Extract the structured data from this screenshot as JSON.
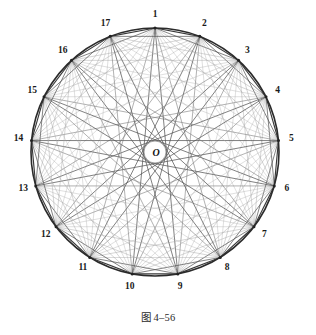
{
  "figure": {
    "caption": "图 4–56",
    "center_point_label": "O",
    "vertex_count": 17,
    "vertex_labels": [
      "1",
      "2",
      "3",
      "4",
      "5",
      "6",
      "7",
      "8",
      "9",
      "10",
      "11",
      "12",
      "13",
      "14",
      "15",
      "16",
      "17"
    ],
    "colors": {
      "background": "#ffffff",
      "circle_outline": "#2b2b2b",
      "chord_dark": "#555555",
      "chord_mid": "#777777",
      "chord_light": "#a8a8a8",
      "label_text": "#1a1a1a",
      "caption_text": "#2a2a2a"
    },
    "geometry": {
      "center_x": 155,
      "center_y": 152,
      "radius": 124,
      "inner_circle_radius": 11,
      "start_angle_deg": -90
    }
  }
}
